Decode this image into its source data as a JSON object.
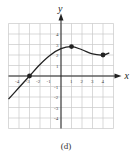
{
  "figure": {
    "caption": "(d)"
  },
  "chart_data": {
    "type": "line",
    "title": "",
    "xlabel": "x",
    "ylabel": "y",
    "xlim": [
      -5,
      5
    ],
    "ylim": [
      -5,
      5
    ],
    "grid": true,
    "x_ticks": [
      -4,
      -3,
      -2,
      -1,
      1,
      2,
      3,
      4
    ],
    "x_tick_labels": [
      "-4",
      "-3",
      "-2",
      "-1",
      "1",
      "2",
      "3",
      "4"
    ],
    "y_ticks": [
      -4,
      -3,
      -2,
      -1,
      1,
      2,
      3,
      4
    ],
    "y_tick_labels": [
      "-4",
      "-3",
      "-2",
      "-1",
      "1",
      "2",
      "3",
      "4"
    ],
    "series": [
      {
        "name": "f(x)",
        "x": [
          -5,
          -4,
          -3,
          -2,
          -1,
          0,
          1,
          2,
          3,
          4,
          4.6
        ],
        "y": [
          -2.2,
          -1.1,
          0,
          1.1,
          2.0,
          2.6,
          2.8,
          2.5,
          2.1,
          2.0,
          2.2
        ]
      }
    ],
    "marked_points": [
      {
        "x": -3,
        "y": 0
      },
      {
        "x": 1,
        "y": 2.8
      },
      {
        "x": 4,
        "y": 2.0
      }
    ],
    "colors": {
      "curve": "#222222",
      "grid": "#c8c8c8",
      "axis": "#222222"
    }
  }
}
